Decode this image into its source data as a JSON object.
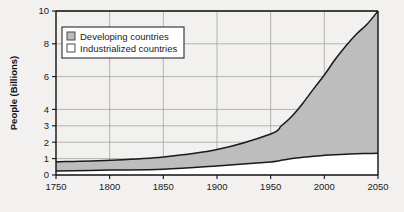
{
  "chart_data": {
    "type": "area",
    "title": "",
    "subtitle": "",
    "xlabel": "",
    "ylabel": "People (Billions)",
    "xlim": [
      1750,
      2050
    ],
    "ylim": [
      0,
      10
    ],
    "grid": true,
    "stacked": true,
    "legend_position": "top-left",
    "x_ticks": [
      "1750",
      "1800",
      "1850",
      "1900",
      "1950",
      "2000",
      "2050"
    ],
    "y_ticks": [
      "0",
      "1",
      "2",
      "3",
      "4",
      "6",
      "8",
      "10"
    ],
    "x": [
      1750,
      1800,
      1850,
      1900,
      1950,
      1960,
      1970,
      1980,
      1990,
      2000,
      2010,
      2020,
      2030,
      2040,
      2050
    ],
    "series": [
      {
        "name": "Industrialized countries",
        "color": "#ffffff",
        "values": [
          0.25,
          0.3,
          0.35,
          0.55,
          0.8,
          0.9,
          1.0,
          1.08,
          1.15,
          1.2,
          1.24,
          1.27,
          1.3,
          1.31,
          1.32
        ]
      },
      {
        "name": "Developing countries",
        "color": "#bdbdbd",
        "values": [
          0.55,
          0.6,
          0.75,
          1.0,
          1.7,
          2.1,
          2.6,
          3.3,
          4.1,
          4.9,
          5.8,
          6.6,
          7.3,
          7.9,
          8.68
        ]
      }
    ],
    "totals": [
      0.8,
      0.9,
      1.1,
      1.55,
      2.5,
      3.0,
      3.6,
      4.38,
      5.25,
      6.1,
      7.04,
      7.87,
      8.6,
      9.21,
      10.0
    ],
    "colors": {
      "developing_fill": "#bdbdbd",
      "industrialized_fill": "#ffffff",
      "line": "#1a1a1a",
      "grid": "#9a9a9a",
      "axis": "#111111",
      "background": "#f2f1ef",
      "legend_box": "#ffffff"
    }
  },
  "legend": {
    "items": [
      {
        "label": "Developing countries",
        "swatch": "#bdbdbd"
      },
      {
        "label": "Industrialized countries",
        "swatch": "#ffffff"
      }
    ]
  },
  "axes": {
    "y_title": "People (Billions)",
    "y_ticks": [
      {
        "label": "10",
        "value": 10
      },
      {
        "label": "8",
        "value": 8
      },
      {
        "label": "6",
        "value": 6
      },
      {
        "label": "4",
        "value": 4
      },
      {
        "label": "3",
        "value": 3
      },
      {
        "label": "2",
        "value": 2
      },
      {
        "label": "1",
        "value": 1
      },
      {
        "label": "0",
        "value": 0
      }
    ],
    "x_ticks": [
      {
        "label": "1750",
        "value": 1750
      },
      {
        "label": "1800",
        "value": 1800
      },
      {
        "label": "1850",
        "value": 1850
      },
      {
        "label": "1900",
        "value": 1900
      },
      {
        "label": "1950",
        "value": 1950
      },
      {
        "label": "2000",
        "value": 2000
      },
      {
        "label": "2050",
        "value": 2050
      }
    ]
  }
}
